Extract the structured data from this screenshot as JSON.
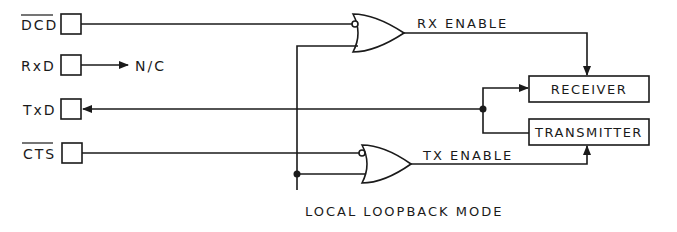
{
  "pins": [
    {
      "name": "DCD",
      "overbar": true,
      "y": 24
    },
    {
      "name": "RxD",
      "overbar": false,
      "y": 65
    },
    {
      "name": "TxD",
      "overbar": false,
      "y": 109
    },
    {
      "name": "CTS",
      "overbar": true,
      "y": 153
    }
  ],
  "labels": {
    "nc": "N/C",
    "rx_enable": "RX ENABLE",
    "tx_enable": "TX ENABLE",
    "mode": "LOCAL LOOPBACK MODE"
  },
  "blocks": {
    "receiver": "RECEIVER",
    "transmitter": "TRANSMITTER"
  },
  "colors": {
    "line": "#1a1a1a",
    "background": "#ffffff"
  }
}
